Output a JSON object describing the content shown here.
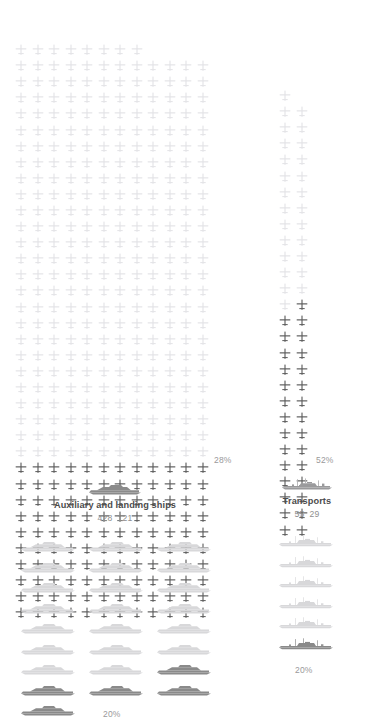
{
  "theme": {
    "background": "#ffffff",
    "pictogram_light": "#e3e3e6",
    "pictogram_dark": "#5a5a5a",
    "ship_light": "#d8d8da",
    "ship_dark": "#8a8a8a",
    "title_color": "#4c4c4c",
    "value_color": "#8f8f8f",
    "percent_color": "#9a9a9a"
  },
  "categories": [
    {
      "id": "auxiliary-and-landing-ships",
      "title": "Auxiliary and landing ships",
      "value_total": "428",
      "value_secondary": "121",
      "icon": "ship-icon"
    },
    {
      "id": "transports",
      "title": "Transports",
      "value_total": "55",
      "value_secondary": "29",
      "icon": "ship-icon"
    }
  ],
  "pictogram_groups": [
    {
      "id": "planes-auxiliary",
      "icon": "aircraft-icon",
      "columns": 12,
      "total": 428,
      "first_row_count": 8,
      "highlighted": 120,
      "percent_label": "28%"
    },
    {
      "id": "planes-transports",
      "icon": "aircraft-icon",
      "columns": 2,
      "total": 55,
      "first_row_count": 1,
      "highlighted": 29,
      "percent_label": "52%"
    },
    {
      "id": "ships-auxiliary",
      "icon": "ship-icon",
      "columns": 3,
      "total": 25,
      "first_row_count": 3,
      "highlighted": 5,
      "percent_label": "20%"
    },
    {
      "id": "ships-transports",
      "icon": "ship-icon",
      "columns": 1,
      "total": 6,
      "first_row_count": 1,
      "highlighted": 1,
      "percent_label": "20%"
    }
  ],
  "chart_data": {
    "type": "pictogram",
    "title": "",
    "unit": "1 icon = 1 vessel",
    "legend": [],
    "grid": false,
    "series": [
      {
        "name": "Auxiliary and landing ships",
        "total": 428,
        "highlighted": 121,
        "percent": 28,
        "percent_label": "28%",
        "icon": "aircraft-icon",
        "columns": 12
      },
      {
        "name": "Transports",
        "total": 55,
        "highlighted": 29,
        "percent": 52,
        "percent_label": "52%",
        "icon": "aircraft-icon",
        "columns": 2
      },
      {
        "name": "Auxiliary and landing ships (vessels)",
        "total": 25,
        "highlighted": 5,
        "percent": 20,
        "percent_label": "20%",
        "icon": "ship-icon",
        "columns": 3
      },
      {
        "name": "Transports (vessels)",
        "total": 6,
        "highlighted": 1,
        "percent": 20,
        "percent_label": "20%",
        "icon": "ship-icon",
        "columns": 1
      }
    ]
  }
}
